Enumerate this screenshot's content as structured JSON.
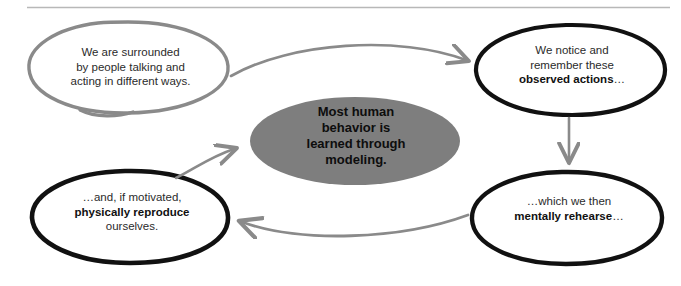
{
  "page": {
    "background_color": "#ffffff",
    "divider_color": "#b8b8b8"
  },
  "palette": {
    "gray_stroke": "#8a8a8a",
    "black_stroke": "#111111",
    "center_fill": "#7e7e7e",
    "text_color": "#2b2b2b",
    "bold_text_color": "#111111"
  },
  "nodes": {
    "top_left": {
      "name": "surrounded-by-people",
      "stroke": "gray",
      "lines": [
        {
          "text": "We are surrounded",
          "bold": false
        },
        {
          "text": "by people talking and",
          "bold": false
        },
        {
          "text": "acting in different ways.",
          "bold": false
        }
      ]
    },
    "top_right": {
      "name": "observed-actions",
      "stroke": "black",
      "lines": [
        {
          "text": "We notice and",
          "bold": false
        },
        {
          "text": "remember these",
          "bold": false
        },
        {
          "text": "observed actions",
          "bold": true,
          "suffix": "…"
        }
      ]
    },
    "bottom_right": {
      "name": "mentally-rehearse",
      "stroke": "black",
      "lines": [
        {
          "text": "…which we then",
          "bold": false
        },
        {
          "text": "mentally rehearse",
          "bold": true,
          "suffix": "…"
        }
      ]
    },
    "bottom_left": {
      "name": "physically-reproduce",
      "stroke": "black",
      "lines": [
        {
          "text": "…and, if motivated,",
          "bold": false
        },
        {
          "text": "physically reproduce",
          "bold": true
        },
        {
          "text": "ourselves.",
          "bold": false
        }
      ]
    },
    "center": {
      "name": "central-thesis",
      "fill": "#7e7e7e",
      "lines": [
        {
          "text": "Most human",
          "bold": true
        },
        {
          "text": "behavior is",
          "bold": true
        },
        {
          "text": "learned through",
          "bold": true
        },
        {
          "text": "modeling.",
          "bold": true
        }
      ]
    }
  },
  "arrows": [
    {
      "name": "arrow-top-left-to-top-right",
      "from": "top_left",
      "to": "top_right",
      "direction": "right",
      "color": "#8a8a8a",
      "style": "curved"
    },
    {
      "name": "arrow-top-right-to-bottom-right",
      "from": "top_right",
      "to": "bottom_right",
      "direction": "down",
      "color": "#8a8a8a",
      "style": "straight"
    },
    {
      "name": "arrow-bottom-right-to-bottom-left",
      "from": "bottom_right",
      "to": "bottom_left",
      "direction": "left",
      "color": "#8a8a8a",
      "style": "curved"
    },
    {
      "name": "arrow-bottom-left-to-center",
      "from": "bottom_left",
      "to": "center",
      "direction": "up-right",
      "color": "#8a8a8a",
      "style": "curved"
    }
  ]
}
